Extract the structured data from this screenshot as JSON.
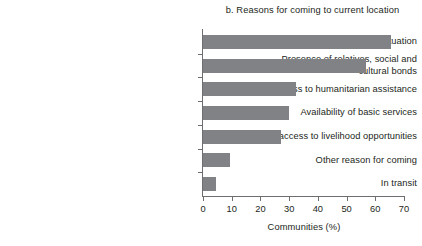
{
  "chart_data": {
    "type": "bar",
    "orientation": "horizontal",
    "title": "b. Reasons for coming to current location",
    "xlabel": "Communities (%)",
    "ylabel": "",
    "xlim": [
      0,
      70
    ],
    "xticks": [
      0,
      10,
      20,
      30,
      40,
      50,
      60,
      70
    ],
    "grid": false,
    "legend": null,
    "bar_color": "#808285",
    "axis_color": "#6d6e71",
    "text_color": "#231f20",
    "categories": [
      "Better security situation",
      "Presence of relatives, social and cultural bonds",
      "Access to humanitarian assistance",
      "Availability of basic services",
      "Better access to livelihood opportunities",
      "Other reason for coming",
      "In transit"
    ],
    "category_lines": [
      [
        "Better security situation"
      ],
      [
        "Presence of relatives, social and",
        "cultural bonds"
      ],
      [
        "Access to humanitarian assistance"
      ],
      [
        "Availability of basic services"
      ],
      [
        "Better access to livelihood opportunities"
      ],
      [
        "Other reason for coming"
      ],
      [
        "In transit"
      ]
    ],
    "values": [
      65.3,
      56.8,
      32.4,
      30.0,
      27.2,
      9.4,
      4.5
    ]
  }
}
